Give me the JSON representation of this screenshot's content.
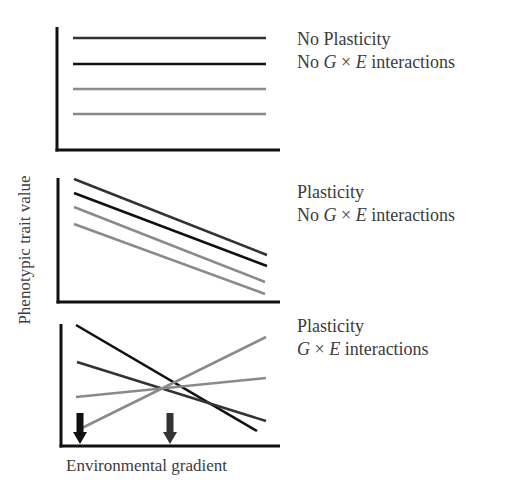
{
  "axes": {
    "ylabel": "Phenotypic trait value",
    "xlabel": "Environmental gradient"
  },
  "panels": [
    {
      "id": "no-plasticity-no-gxe",
      "title_line1": "No Plasticity",
      "title_line2_prefix": "No ",
      "title_line2_G": "G",
      "title_line2_times": " × ",
      "title_line2_E": "E",
      "title_line2_suffix": " interactions",
      "frame": {
        "x0": 57,
        "y0": 27,
        "x1": 280,
        "y1": 150
      },
      "lines": [
        {
          "x1": 73,
          "y1": 38,
          "x2": 266,
          "y2": 38,
          "color": "#333333"
        },
        {
          "x1": 73,
          "y1": 64,
          "x2": 266,
          "y2": 64,
          "color": "#111111"
        },
        {
          "x1": 73,
          "y1": 89,
          "x2": 266,
          "y2": 89,
          "color": "#8a8a8a"
        },
        {
          "x1": 73,
          "y1": 114,
          "x2": 266,
          "y2": 114,
          "color": "#8a8a8a"
        }
      ]
    },
    {
      "id": "plasticity-no-gxe",
      "title_line1": "Plasticity",
      "title_line2_prefix": "No ",
      "title_line2_G": "G",
      "title_line2_times": " × ",
      "title_line2_E": "E",
      "title_line2_suffix": " interactions",
      "frame": {
        "x0": 58,
        "y0": 178,
        "x1": 280,
        "y1": 302
      },
      "lines": [
        {
          "x1": 74,
          "y1": 179,
          "x2": 267,
          "y2": 255,
          "color": "#333333"
        },
        {
          "x1": 74,
          "y1": 193,
          "x2": 267,
          "y2": 266,
          "color": "#111111"
        },
        {
          "x1": 74,
          "y1": 207,
          "x2": 265,
          "y2": 282,
          "color": "#8a8a8a"
        },
        {
          "x1": 74,
          "y1": 224,
          "x2": 265,
          "y2": 294,
          "color": "#8a8a8a"
        }
      ]
    },
    {
      "id": "plasticity-gxe",
      "title_line1": "Plasticity",
      "title_line2_prefix": "",
      "title_line2_G": "G",
      "title_line2_times": " × ",
      "title_line2_E": "E",
      "title_line2_suffix": " interactions",
      "frame": {
        "x0": 61,
        "y0": 324,
        "x1": 280,
        "y1": 446
      },
      "lines": [
        {
          "x1": 76,
          "y1": 325,
          "x2": 257,
          "y2": 431,
          "color": "#111111"
        },
        {
          "x1": 77,
          "y1": 362,
          "x2": 266,
          "y2": 421,
          "color": "#333333"
        },
        {
          "x1": 76,
          "y1": 397,
          "x2": 266,
          "y2": 378,
          "color": "#8a8a8a"
        },
        {
          "x1": 82,
          "y1": 428,
          "x2": 266,
          "y2": 337,
          "color": "#8a8a8a"
        }
      ],
      "arrows": [
        {
          "x": 80,
          "y_top": 413,
          "y_tip": 444,
          "color": "#111111"
        },
        {
          "x": 170,
          "y_top": 413,
          "y_tip": 444,
          "color": "#333333"
        }
      ]
    }
  ],
  "colors": {
    "axis": "#111111",
    "genotype_dark": "#111111",
    "genotype_darkgray": "#333333",
    "genotype_gray": "#8a8a8a",
    "text": "#3c3c3c"
  }
}
